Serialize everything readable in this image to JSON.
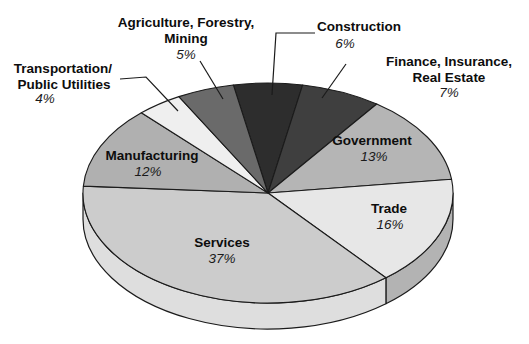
{
  "figure": {
    "background": "#ffffff",
    "outline_color": "#1b1b1b",
    "label_color": "#0d0d0d"
  },
  "chart_data": {
    "type": "pie",
    "title": "",
    "units": "%",
    "total": 100,
    "clockwise": true,
    "rotation_deg": -10.8,
    "three_d": true,
    "legend": "none (labels attached to slices, leader lines for small slices)",
    "categories": [
      "Construction",
      "Finance, Insurance, Real Estate",
      "Government",
      "Trade",
      "Services",
      "Manufacturing",
      "Transportation/Public Utilities",
      "Agriculture, Forestry, Mining"
    ],
    "values": [
      6,
      7,
      13,
      16,
      37,
      12,
      4,
      5
    ],
    "geometry": {
      "cx": 268,
      "cy": 193,
      "rx": 185,
      "ry": 110,
      "depth": 26
    },
    "outline_color": "#1b1b1b",
    "slices": [
      {
        "id": "construction",
        "label": "Construction",
        "value": 6,
        "pct_text": "6%",
        "color": "#2d2d2d",
        "label_placement": "outside",
        "label_lines": [
          {
            "t": "Construction",
            "x": 359,
            "y": 27,
            "k": "name"
          },
          {
            "t": "6%",
            "x": 345,
            "y": 44,
            "k": "pct"
          }
        ],
        "leader": [
          [
            315,
            33
          ],
          [
            276,
            33
          ],
          [
            272,
            95
          ]
        ]
      },
      {
        "id": "finance",
        "label": "Finance, Insurance, Real Estate",
        "value": 7,
        "pct_text": "7%",
        "color": "#3f3f3f",
        "label_placement": "outside",
        "label_lines": [
          {
            "t": "Finance, Insurance,",
            "x": 449,
            "y": 62,
            "k": "name"
          },
          {
            "t": "Real Estate",
            "x": 449,
            "y": 78,
            "k": "name"
          },
          {
            "t": "7%",
            "x": 449,
            "y": 93,
            "k": "pct"
          }
        ],
        "leader": [
          [
            346,
            64
          ],
          [
            322,
            98
          ]
        ]
      },
      {
        "id": "government",
        "label": "Government",
        "value": 13,
        "pct_text": "13%",
        "color": "#b5b5b5",
        "label_placement": "inside",
        "label_lines": [
          {
            "t": "Government",
            "x": 372,
            "y": 141,
            "k": "name"
          },
          {
            "t": "13%",
            "x": 374,
            "y": 157,
            "k": "pct"
          }
        ]
      },
      {
        "id": "trade",
        "label": "Trade",
        "value": 16,
        "pct_text": "16%",
        "color": "#e7e7e7",
        "side_color": "#b3b3b3",
        "label_placement": "inside",
        "label_lines": [
          {
            "t": "Trade",
            "x": 389,
            "y": 209,
            "k": "name"
          },
          {
            "t": "16%",
            "x": 390,
            "y": 225,
            "k": "pct"
          }
        ]
      },
      {
        "id": "services",
        "label": "Services",
        "value": 37,
        "pct_text": "37%",
        "color": "#cccccc",
        "side_color": "#dedede",
        "label_placement": "inside",
        "label_lines": [
          {
            "t": "Services",
            "x": 222,
            "y": 243,
            "k": "name"
          },
          {
            "t": "37%",
            "x": 222,
            "y": 259,
            "k": "pct"
          }
        ]
      },
      {
        "id": "manufacturing",
        "label": "Manufacturing",
        "value": 12,
        "pct_text": "12%",
        "color": "#b0b0b0",
        "label_placement": "inside",
        "label_lines": [
          {
            "t": "Manufacturing",
            "x": 152,
            "y": 156,
            "k": "name"
          },
          {
            "t": "12%",
            "x": 148,
            "y": 172,
            "k": "pct"
          }
        ]
      },
      {
        "id": "transportation",
        "label": "Transportation/Public Utilities",
        "value": 4,
        "pct_text": "4%",
        "color": "#efefef",
        "label_placement": "outside",
        "label_lines": [
          {
            "t": "Transportation/",
            "x": 63,
            "y": 69,
            "k": "name"
          },
          {
            "t": "Public Utilities",
            "x": 64,
            "y": 85,
            "k": "name"
          },
          {
            "t": "4%",
            "x": 45,
            "y": 99,
            "k": "pct"
          }
        ],
        "leader": [
          [
            120,
            79
          ],
          [
            146,
            77
          ],
          [
            178,
            111
          ]
        ]
      },
      {
        "id": "agriculture",
        "label": "Agriculture, Forestry, Mining",
        "value": 5,
        "pct_text": "5%",
        "color": "#6a6a6a",
        "label_placement": "outside",
        "label_lines": [
          {
            "t": "Agriculture, Forestry,",
            "x": 186,
            "y": 23,
            "k": "name"
          },
          {
            "t": "Mining",
            "x": 186,
            "y": 39,
            "k": "name"
          },
          {
            "t": "5%",
            "x": 186,
            "y": 55,
            "k": "pct"
          }
        ],
        "leader": [
          [
            200,
            61
          ],
          [
            223,
            99
          ]
        ]
      }
    ]
  }
}
